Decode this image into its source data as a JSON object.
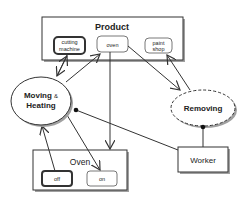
{
  "diagram": {
    "containers": {
      "product": {
        "label": "Product"
      },
      "oven": {
        "label": "Oven"
      }
    },
    "states": {
      "cutting_machine": {
        "line1": "cutting",
        "line2": "machine"
      },
      "oven_state": {
        "label": "oven"
      },
      "paint_shop": {
        "line1": "paint",
        "line2": "shop"
      },
      "off": {
        "label": "off"
      },
      "on": {
        "label": "on"
      }
    },
    "processes": {
      "moving_heating": {
        "line1": "Moving",
        "amp": "&",
        "line2": "Heating"
      },
      "removing": {
        "label": "Removing"
      }
    },
    "objects": {
      "worker": {
        "label": "Worker"
      }
    },
    "colors": {
      "stroke": "#333333",
      "shadow": "#9a9a9a",
      "fill": "#ffffff",
      "text": "#222222"
    }
  }
}
